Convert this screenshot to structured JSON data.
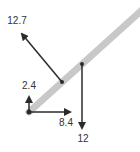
{
  "diagram": {
    "type": "free-body force diagram",
    "colors": {
      "beam": "#c8c8c8",
      "vector": "#2b2b2b",
      "label": "#333333",
      "background": "#ffffff"
    },
    "beam": {
      "from": [
        29,
        112
      ],
      "to": [
        142,
        10
      ]
    },
    "forces": [
      {
        "id": "tension",
        "label": "12.7",
        "from": [
          62,
          82
        ],
        "to": [
          20,
          32
        ],
        "label_pos": [
          17,
          24
        ]
      },
      {
        "id": "weight",
        "label": "12",
        "from": [
          82,
          64
        ],
        "to": [
          82,
          130
        ],
        "label_pos": [
          83,
          141
        ]
      },
      {
        "id": "reaction-vertical",
        "label": "2.4",
        "from": [
          29,
          112
        ],
        "to": [
          29,
          95
        ],
        "label_pos": [
          29,
          88
        ]
      },
      {
        "id": "reaction-horizontal",
        "label": "8.4",
        "from": [
          29,
          112
        ],
        "to": [
          72,
          112
        ],
        "label_pos": [
          66,
          125
        ]
      }
    ]
  }
}
